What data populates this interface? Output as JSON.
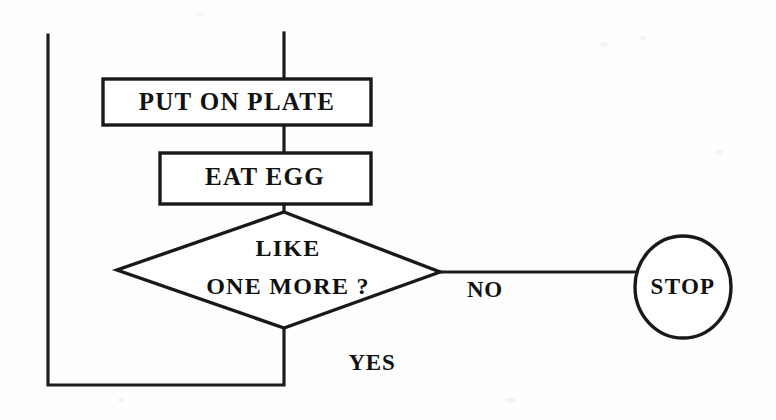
{
  "diagram": {
    "type": "flowchart",
    "background_color": "#fefefe",
    "stroke_color": "#191919",
    "text_color": "#111111",
    "nodes": [
      {
        "id": "put-on-plate",
        "shape": "process",
        "label": "PUT ON PLATE",
        "x": 103,
        "y": 79,
        "width": 268,
        "height": 46
      },
      {
        "id": "eat-egg",
        "shape": "process",
        "label": "EAT EGG",
        "x": 160,
        "y": 153,
        "width": 211,
        "height": 51
      },
      {
        "id": "like-one-more",
        "shape": "decision",
        "label_line_1": "LIKE",
        "label_line_2": "ONE MORE ?",
        "cx": 284,
        "cy": 270,
        "half_width": 167,
        "half_height": 58
      },
      {
        "id": "stop",
        "shape": "terminal",
        "label": "STOP",
        "cx": 683,
        "cy": 287,
        "rx": 48,
        "ry": 51
      }
    ],
    "edges": [
      {
        "id": "entry-to-put-on-plate",
        "from": "entry",
        "to": "put-on-plate",
        "label": ""
      },
      {
        "id": "put-on-plate-to-eat-egg",
        "from": "put-on-plate",
        "to": "eat-egg",
        "label": ""
      },
      {
        "id": "eat-egg-to-decision",
        "from": "eat-egg",
        "to": "like-one-more",
        "label": ""
      },
      {
        "id": "decision-no-to-stop",
        "from": "like-one-more",
        "to": "stop",
        "label": "NO",
        "label_x": 485,
        "label_y": 292
      },
      {
        "id": "decision-yes-loop-back",
        "from": "like-one-more",
        "to": "put-on-plate",
        "label": "YES",
        "label_x": 372,
        "label_y": 365
      }
    ]
  }
}
